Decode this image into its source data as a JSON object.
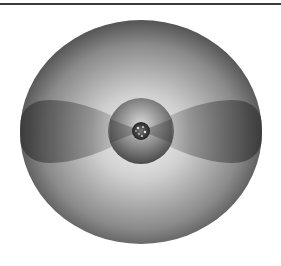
{
  "figure": {
    "colors": {
      "background": "#ffffff",
      "rule": "#3a3a3a",
      "outer_edge": "#4a4a4a",
      "outer_center": "#f2f2f2",
      "lobe_edge": "#3c3c3c",
      "lobe_inner": "#9a9a9a",
      "inner_sphere_edge": "#505050",
      "inner_sphere_center": "#cfcfcf",
      "core": "#2a2a2a"
    },
    "outer_sphere": {
      "cx": 141,
      "cy": 132,
      "rx": 121,
      "ry": 112
    },
    "inner_sphere": {
      "cx": 141,
      "cy": 131,
      "r": 33
    },
    "core": {
      "cx": 141,
      "cy": 131,
      "r": 9
    },
    "lobes": {
      "left_x": 21,
      "right_x": 261,
      "top_y": 100,
      "bottom_y": 163
    }
  }
}
